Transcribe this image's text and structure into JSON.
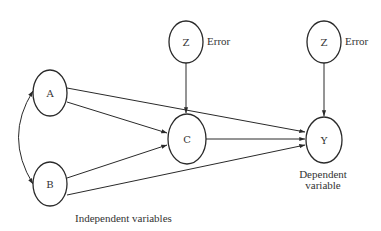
{
  "diagram": {
    "type": "path-diagram",
    "nodes": {
      "A": {
        "label": "A",
        "cx": 50,
        "cy": 93,
        "rx": 17,
        "ry": 23
      },
      "B": {
        "label": "B",
        "cx": 50,
        "cy": 184,
        "rx": 17,
        "ry": 22
      },
      "C": {
        "label": "C",
        "cx": 187,
        "cy": 139,
        "rx": 19,
        "ry": 25
      },
      "Y": {
        "label": "Y",
        "cx": 324,
        "cy": 140,
        "rx": 18,
        "ry": 23
      },
      "Z1": {
        "label": "Z",
        "cx": 186,
        "cy": 42,
        "rx": 17,
        "ry": 21
      },
      "Z2": {
        "label": "Z",
        "cx": 324,
        "cy": 42,
        "rx": 17,
        "ry": 21
      }
    },
    "edges": [
      {
        "from": "A",
        "to": "Y",
        "type": "directed"
      },
      {
        "from": "A",
        "to": "C",
        "type": "directed"
      },
      {
        "from": "B",
        "to": "C",
        "type": "directed"
      },
      {
        "from": "B",
        "to": "Y",
        "type": "directed"
      },
      {
        "from": "C",
        "to": "Y",
        "type": "directed"
      },
      {
        "from": "Z1",
        "to": "C",
        "type": "directed"
      },
      {
        "from": "Z2",
        "to": "Y",
        "type": "directed"
      },
      {
        "from": "A",
        "to": "B",
        "type": "bidirectional-curved"
      }
    ],
    "labels": {
      "error_1": "Error",
      "error_2": "Error",
      "dependent_line1": "Dependent",
      "dependent_line2": "variable",
      "independent": "Independent variables"
    },
    "colors": {
      "stroke": "#2a2a2a",
      "text": "#333333",
      "background": "#ffffff"
    }
  }
}
